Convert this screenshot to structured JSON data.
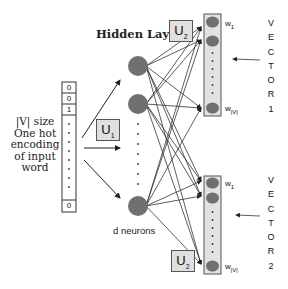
{
  "diagram": {
    "type": "neural-network-architecture",
    "input": {
      "description_lines": [
        "|V| size",
        "One hot",
        "encoding",
        "of input",
        "word"
      ],
      "vector_cells": [
        "0",
        "0",
        "1",
        "0"
      ],
      "ellipsis": "⋮"
    },
    "weights": {
      "u1": {
        "main": "U",
        "sub": "1"
      },
      "u2_top": {
        "main": "U",
        "sub": "2"
      },
      "u2_bottom": {
        "main": "U",
        "sub": "2"
      }
    },
    "hidden_layer": {
      "title": "Hidden Layer",
      "footer": "d neurons"
    },
    "outputs": [
      {
        "first_label": {
          "main": "w",
          "sub": "1"
        },
        "last_label": {
          "main": "w",
          "sub": "|V|"
        },
        "vertical_text": [
          "V",
          "E",
          "C",
          "T",
          "O",
          "R",
          "1"
        ]
      },
      {
        "first_label": {
          "main": "w",
          "sub": "1"
        },
        "last_label": {
          "main": "w",
          "sub": "|V|"
        },
        "vertical_text": [
          "V",
          "E",
          "C",
          "T",
          "O",
          "R",
          "2"
        ]
      }
    ],
    "colors": {
      "node_fill": "#707070",
      "output_panel": "#e2e2e2",
      "edge": "#333333",
      "label_box": "#e0e0e0"
    }
  }
}
